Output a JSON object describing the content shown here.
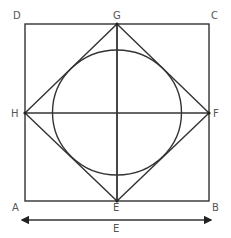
{
  "diagram": {
    "type": "geometric-construction",
    "stroke_color": "#333333",
    "label_color": "#555555",
    "labels": {
      "A": "A",
      "B": "B",
      "C": "C",
      "D": "D",
      "E": "E",
      "F": "F",
      "G": "G",
      "H": "H",
      "dimension": "E"
    },
    "points": {
      "A": [
        25,
        201
      ],
      "B": [
        209,
        201
      ],
      "C": [
        209,
        24
      ],
      "D": [
        25,
        24
      ],
      "E": [
        117,
        201
      ],
      "F": [
        209,
        113
      ],
      "G": [
        117,
        24
      ],
      "H": [
        25,
        113
      ]
    },
    "circle": {
      "cx": 117,
      "cy": 112.5,
      "r": 63
    },
    "dimension_arrow": {
      "x1": 20,
      "x2": 213,
      "y": 220
    }
  }
}
